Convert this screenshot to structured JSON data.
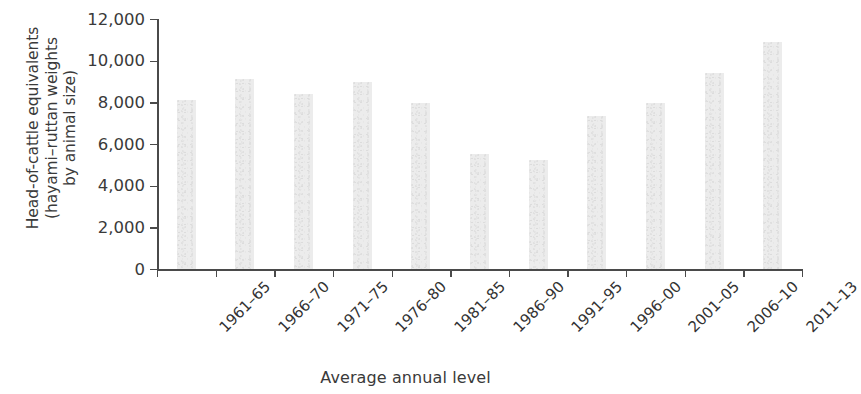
{
  "chart_data": {
    "type": "bar",
    "title": "",
    "xlabel": "Average annual level",
    "ylabel": "Head-of-cattle equivalents (hayami–ruttan weights by animal size)",
    "ylabel_lines": [
      "Head-of-cattle equivalents",
      "(hayami–ruttan weights",
      "by animal size)"
    ],
    "categories": [
      "1961–65",
      "1966–70",
      "1971–75",
      "1976–80",
      "1981–85",
      "1986–90",
      "1991–95",
      "1996–00",
      "2001–05",
      "2006–10",
      "2011–13"
    ],
    "values": [
      8100,
      9100,
      8400,
      9000,
      7950,
      5500,
      5250,
      7350,
      7950,
      9400,
      10900
    ],
    "ylim": [
      0,
      12000
    ],
    "ytick_values": [
      0,
      2000,
      4000,
      6000,
      8000,
      10000,
      12000
    ],
    "ytick_labels": [
      "0",
      "2,000",
      "4,000",
      "6,000",
      "8,000",
      "10,000",
      "12,000"
    ],
    "grid": false,
    "legend": false,
    "bar_color": "#ececec",
    "axis_color": "#4a4a4a",
    "text_color": "#3a3a3a"
  }
}
